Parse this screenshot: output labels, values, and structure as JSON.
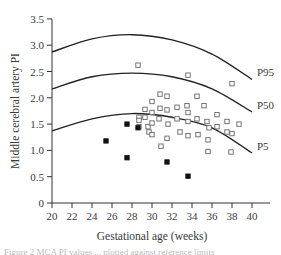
{
  "chart_data": {
    "type": "scatter",
    "title": "",
    "xlabel": "Gestational age (weeks)",
    "ylabel": "Middle cerebral artery PI",
    "xlim": [
      20,
      41
    ],
    "ylim": [
      0,
      3.5
    ],
    "x_ticks": [
      "20",
      "22",
      "24",
      "26",
      "28",
      "30",
      "32",
      "34",
      "36",
      "38",
      "40"
    ],
    "y_ticks": [
      "0",
      "0.5",
      "1.0",
      "1.5",
      "2.0",
      "2.5",
      "3.0",
      "3.5"
    ],
    "grid": false,
    "legend": "none",
    "reference_curves": [
      {
        "name": "P95",
        "x": [
          20,
          24,
          28,
          32,
          36,
          40
        ],
        "y": [
          2.87,
          3.12,
          3.2,
          3.1,
          2.83,
          2.35
        ]
      },
      {
        "name": "P50",
        "x": [
          20,
          24,
          28,
          32,
          36,
          40
        ],
        "y": [
          2.17,
          2.4,
          2.47,
          2.4,
          2.17,
          1.73
        ]
      },
      {
        "name": "P5",
        "x": [
          20,
          24,
          28,
          32,
          36,
          40
        ],
        "y": [
          1.37,
          1.6,
          1.7,
          1.63,
          1.43,
          0.95
        ]
      }
    ],
    "series": [
      {
        "name": "open squares",
        "marker": "open-square",
        "points": [
          [
            28.6,
            2.62
          ],
          [
            28.7,
            1.63
          ],
          [
            28.7,
            1.57
          ],
          [
            28.7,
            1.45
          ],
          [
            29.3,
            1.78
          ],
          [
            29.3,
            1.63
          ],
          [
            29.6,
            1.45
          ],
          [
            29.7,
            1.35
          ],
          [
            30.0,
            1.93
          ],
          [
            30.0,
            1.72
          ],
          [
            30.0,
            1.52
          ],
          [
            30.0,
            1.3
          ],
          [
            30.8,
            2.07
          ],
          [
            30.8,
            1.8
          ],
          [
            30.7,
            1.6
          ],
          [
            30.9,
            1.08
          ],
          [
            31.5,
            2.03
          ],
          [
            31.5,
            1.77
          ],
          [
            31.6,
            1.5
          ],
          [
            31.5,
            1.23
          ],
          [
            32.5,
            1.82
          ],
          [
            32.5,
            1.6
          ],
          [
            32.8,
            1.35
          ],
          [
            33.6,
            2.43
          ],
          [
            33.5,
            1.85
          ],
          [
            33.6,
            1.72
          ],
          [
            33.6,
            1.55
          ],
          [
            33.6,
            1.28
          ],
          [
            34.5,
            2.03
          ],
          [
            34.5,
            1.6
          ],
          [
            34.6,
            1.3
          ],
          [
            35.2,
            1.85
          ],
          [
            35.5,
            1.55
          ],
          [
            35.7,
            1.43
          ],
          [
            35.6,
            1.2
          ],
          [
            35.6,
            0.98
          ],
          [
            36.5,
            1.68
          ],
          [
            36.5,
            1.45
          ],
          [
            37.5,
            1.55
          ],
          [
            37.5,
            1.35
          ],
          [
            38.0,
            2.27
          ],
          [
            38.0,
            1.32
          ],
          [
            37.9,
            0.97
          ],
          [
            38.7,
            1.5
          ]
        ]
      },
      {
        "name": "filled squares",
        "marker": "filled-square",
        "points": [
          [
            25.4,
            1.18
          ],
          [
            27.5,
            1.5
          ],
          [
            27.5,
            0.86
          ],
          [
            28.6,
            1.43
          ],
          [
            31.5,
            0.78
          ],
          [
            33.6,
            0.51
          ]
        ]
      }
    ]
  },
  "caption_fragment": "Figure 2  MCA PI values ... plotted against reference limits"
}
